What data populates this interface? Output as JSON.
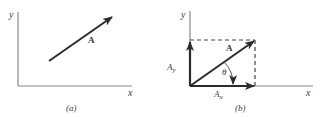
{
  "figure_a": {
    "caption": "(a)",
    "x_axis_label": "x",
    "y_axis_label": "y",
    "vector_label": "A"
  },
  "figure_b": {
    "caption": "(b)",
    "x_axis_label": "x",
    "y_axis_label": "y",
    "vector_label": "A",
    "x_component_label": "A",
    "x_component_subscript": "x",
    "y_component_label": "A",
    "y_component_subscript": "y",
    "angle_label": "θ"
  },
  "colors": {
    "axis": "#8a8a8a",
    "vector": "#2b2b2b",
    "dashed": "#444444",
    "text": "#3a3a3a"
  }
}
